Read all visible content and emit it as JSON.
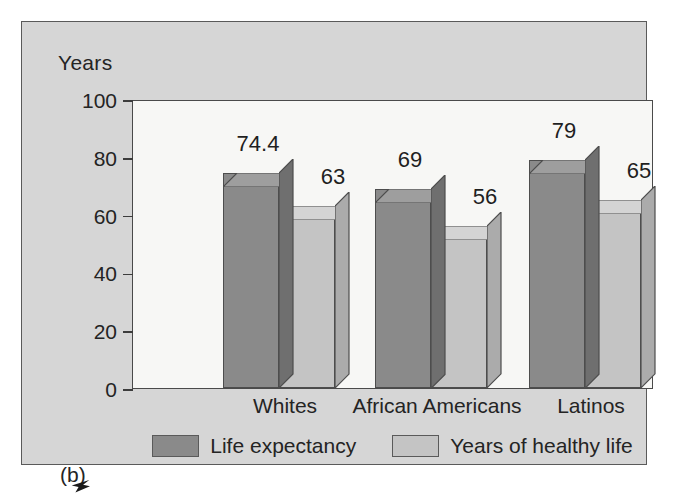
{
  "figure": {
    "subfigure_label": "(b)",
    "background_color": "#d6d6d6",
    "plot_background_color": "#f7f7f5",
    "frame_color": "#5a5a5a"
  },
  "chart_data": {
    "type": "bar",
    "title": "",
    "subtitle": "",
    "xlabel": "",
    "ylabel": "Years",
    "ylim": [
      0,
      100
    ],
    "yticks": [
      0,
      20,
      40,
      60,
      80,
      100
    ],
    "ytick_labels": [
      "0",
      "20",
      "40",
      "60",
      "80",
      "100"
    ],
    "grid": false,
    "legend_position": "bottom-center",
    "three_d": true,
    "categories": [
      "Whites",
      "African Americans",
      "Latinos"
    ],
    "series": [
      {
        "name": "Life expectancy",
        "color": "#8a8a8a",
        "top_color": "#9e9e9e",
        "side_color": "#6f6f6f",
        "values": [
          74.4,
          69,
          79
        ],
        "value_labels": [
          "74.4",
          "69",
          "79"
        ]
      },
      {
        "name": "Years of healthy life",
        "color": "#c4c4c4",
        "top_color": "#d4d4d4",
        "side_color": "#ababab",
        "values": [
          63,
          56,
          65
        ],
        "value_labels": [
          "63",
          "56",
          "65"
        ]
      }
    ]
  }
}
